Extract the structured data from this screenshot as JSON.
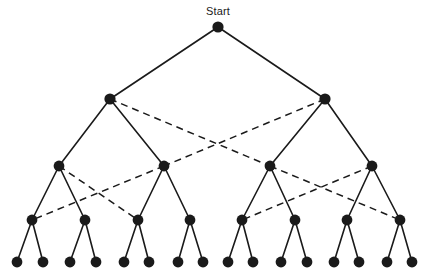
{
  "diagram": {
    "title": "Start",
    "type": "binary-decision-tree",
    "canvas": {
      "width": 430,
      "height": 278,
      "background": "#ffffff"
    },
    "colors": {
      "node": "#1a1a1a",
      "edge": "#1a1a1a",
      "dashed_edge": "#1a1a1a"
    },
    "labels": [
      {
        "id": "start-label",
        "text": "Start",
        "x": 218,
        "y": 5
      }
    ],
    "levels": [
      {
        "level": 0,
        "y": 27,
        "node_radius": 5.6
      },
      {
        "level": 1,
        "y": 99,
        "node_radius": 5.6
      },
      {
        "level": 2,
        "y": 166,
        "node_radius": 5.4
      },
      {
        "level": 3,
        "y": 220,
        "node_radius": 5.4
      },
      {
        "level": 4,
        "y": 262,
        "node_radius": 5.4
      }
    ],
    "nodes": [
      {
        "id": "n0",
        "level": 0,
        "x": 218,
        "y": 27,
        "r": 5.6
      },
      {
        "id": "n1a",
        "level": 1,
        "x": 110,
        "y": 99,
        "r": 5.6
      },
      {
        "id": "n1b",
        "level": 1,
        "x": 325,
        "y": 99,
        "r": 5.6
      },
      {
        "id": "n2a",
        "level": 2,
        "x": 59,
        "y": 166,
        "r": 5.4
      },
      {
        "id": "n2b",
        "level": 2,
        "x": 164,
        "y": 166,
        "r": 5.4
      },
      {
        "id": "n2c",
        "level": 2,
        "x": 270,
        "y": 166,
        "r": 5.4
      },
      {
        "id": "n2d",
        "level": 2,
        "x": 372,
        "y": 166,
        "r": 5.4
      },
      {
        "id": "n3a",
        "level": 3,
        "x": 32,
        "y": 220,
        "r": 5.4
      },
      {
        "id": "n3b",
        "level": 3,
        "x": 85,
        "y": 220,
        "r": 5.4
      },
      {
        "id": "n3c",
        "level": 3,
        "x": 138,
        "y": 220,
        "r": 5.4
      },
      {
        "id": "n3d",
        "level": 3,
        "x": 190,
        "y": 220,
        "r": 5.4
      },
      {
        "id": "n3e",
        "level": 3,
        "x": 242,
        "y": 220,
        "r": 5.4
      },
      {
        "id": "n3f",
        "level": 3,
        "x": 295,
        "y": 220,
        "r": 5.4
      },
      {
        "id": "n3g",
        "level": 3,
        "x": 347,
        "y": 220,
        "r": 5.4
      },
      {
        "id": "n3h",
        "level": 3,
        "x": 400,
        "y": 220,
        "r": 5.4
      },
      {
        "id": "n4a",
        "level": 4,
        "x": 17,
        "y": 262,
        "r": 5.4
      },
      {
        "id": "n4b",
        "level": 4,
        "x": 43,
        "y": 262,
        "r": 5.4
      },
      {
        "id": "n4c",
        "level": 4,
        "x": 70,
        "y": 262,
        "r": 5.4
      },
      {
        "id": "n4d",
        "level": 4,
        "x": 96,
        "y": 262,
        "r": 5.4
      },
      {
        "id": "n4e",
        "level": 4,
        "x": 124,
        "y": 262,
        "r": 5.4
      },
      {
        "id": "n4f",
        "level": 4,
        "x": 149,
        "y": 262,
        "r": 5.4
      },
      {
        "id": "n4g",
        "level": 4,
        "x": 178,
        "y": 262,
        "r": 5.4
      },
      {
        "id": "n4h",
        "level": 4,
        "x": 203,
        "y": 262,
        "r": 5.4
      },
      {
        "id": "n4i",
        "level": 4,
        "x": 228,
        "y": 262,
        "r": 5.4
      },
      {
        "id": "n4j",
        "level": 4,
        "x": 253,
        "y": 262,
        "r": 5.4
      },
      {
        "id": "n4k",
        "level": 4,
        "x": 281,
        "y": 262,
        "r": 5.4
      },
      {
        "id": "n4l",
        "level": 4,
        "x": 307,
        "y": 262,
        "r": 5.4
      },
      {
        "id": "n4m",
        "level": 4,
        "x": 334,
        "y": 262,
        "r": 5.4
      },
      {
        "id": "n4n",
        "level": 4,
        "x": 359,
        "y": 262,
        "r": 5.4
      },
      {
        "id": "n4o",
        "level": 4,
        "x": 387,
        "y": 262,
        "r": 5.4
      },
      {
        "id": "n4p",
        "level": 4,
        "x": 412,
        "y": 262,
        "r": 5.4
      }
    ],
    "edges_solid": [
      {
        "from": "n0",
        "to": "n1a",
        "x1": 218,
        "y1": 27,
        "x2": 110,
        "y2": 99
      },
      {
        "from": "n0",
        "to": "n1b",
        "x1": 218,
        "y1": 27,
        "x2": 325,
        "y2": 99
      },
      {
        "from": "n1a",
        "to": "n2a",
        "x1": 110,
        "y1": 99,
        "x2": 59,
        "y2": 166
      },
      {
        "from": "n1a",
        "to": "n2b",
        "x1": 110,
        "y1": 99,
        "x2": 164,
        "y2": 166
      },
      {
        "from": "n1b",
        "to": "n2c",
        "x1": 325,
        "y1": 99,
        "x2": 270,
        "y2": 166
      },
      {
        "from": "n1b",
        "to": "n2d",
        "x1": 325,
        "y1": 99,
        "x2": 372,
        "y2": 166
      },
      {
        "from": "n2a",
        "to": "n3a",
        "x1": 59,
        "y1": 166,
        "x2": 32,
        "y2": 220
      },
      {
        "from": "n2a",
        "to": "n3b",
        "x1": 59,
        "y1": 166,
        "x2": 85,
        "y2": 220
      },
      {
        "from": "n2b",
        "to": "n3c",
        "x1": 164,
        "y1": 166,
        "x2": 138,
        "y2": 220
      },
      {
        "from": "n2b",
        "to": "n3d",
        "x1": 164,
        "y1": 166,
        "x2": 190,
        "y2": 220
      },
      {
        "from": "n2c",
        "to": "n3e",
        "x1": 270,
        "y1": 166,
        "x2": 242,
        "y2": 220
      },
      {
        "from": "n2c",
        "to": "n3f",
        "x1": 270,
        "y1": 166,
        "x2": 295,
        "y2": 220
      },
      {
        "from": "n2d",
        "to": "n3g",
        "x1": 372,
        "y1": 166,
        "x2": 347,
        "y2": 220
      },
      {
        "from": "n2d",
        "to": "n3h",
        "x1": 372,
        "y1": 166,
        "x2": 400,
        "y2": 220
      },
      {
        "from": "n3a",
        "to": "n4a",
        "x1": 32,
        "y1": 220,
        "x2": 17,
        "y2": 262
      },
      {
        "from": "n3a",
        "to": "n4b",
        "x1": 32,
        "y1": 220,
        "x2": 43,
        "y2": 262
      },
      {
        "from": "n3b",
        "to": "n4c",
        "x1": 85,
        "y1": 220,
        "x2": 70,
        "y2": 262
      },
      {
        "from": "n3b",
        "to": "n4d",
        "x1": 85,
        "y1": 220,
        "x2": 96,
        "y2": 262
      },
      {
        "from": "n3c",
        "to": "n4e",
        "x1": 138,
        "y1": 220,
        "x2": 124,
        "y2": 262
      },
      {
        "from": "n3c",
        "to": "n4f",
        "x1": 138,
        "y1": 220,
        "x2": 149,
        "y2": 262
      },
      {
        "from": "n3d",
        "to": "n4g",
        "x1": 190,
        "y1": 220,
        "x2": 178,
        "y2": 262
      },
      {
        "from": "n3d",
        "to": "n4h",
        "x1": 190,
        "y1": 220,
        "x2": 203,
        "y2": 262
      },
      {
        "from": "n3e",
        "to": "n4i",
        "x1": 242,
        "y1": 220,
        "x2": 228,
        "y2": 262
      },
      {
        "from": "n3e",
        "to": "n4j",
        "x1": 242,
        "y1": 220,
        "x2": 253,
        "y2": 262
      },
      {
        "from": "n3f",
        "to": "n4k",
        "x1": 295,
        "y1": 220,
        "x2": 281,
        "y2": 262
      },
      {
        "from": "n3f",
        "to": "n4l",
        "x1": 295,
        "y1": 220,
        "x2": 307,
        "y2": 262
      },
      {
        "from": "n3g",
        "to": "n4m",
        "x1": 347,
        "y1": 220,
        "x2": 334,
        "y2": 262
      },
      {
        "from": "n3g",
        "to": "n4n",
        "x1": 347,
        "y1": 220,
        "x2": 359,
        "y2": 262
      },
      {
        "from": "n3h",
        "to": "n4o",
        "x1": 400,
        "y1": 220,
        "x2": 387,
        "y2": 262
      },
      {
        "from": "n3h",
        "to": "n4p",
        "x1": 400,
        "y1": 220,
        "x2": 412,
        "y2": 262
      }
    ],
    "edges_dashed": [
      {
        "from": "n1a",
        "to": "n2c",
        "x1": 110,
        "y1": 99,
        "x2": 270,
        "y2": 166
      },
      {
        "from": "n1b",
        "to": "n2b",
        "x1": 325,
        "y1": 99,
        "x2": 164,
        "y2": 166
      },
      {
        "from": "n2a",
        "to": "n3c",
        "x1": 59,
        "y1": 166,
        "x2": 138,
        "y2": 220
      },
      {
        "from": "n2b",
        "to": "n3a",
        "x1": 164,
        "y1": 166,
        "x2": 32,
        "y2": 220
      },
      {
        "from": "n2c",
        "to": "n3h",
        "x1": 270,
        "y1": 166,
        "x2": 400,
        "y2": 220
      },
      {
        "from": "n2d",
        "to": "n3e",
        "x1": 372,
        "y1": 166,
        "x2": 242,
        "y2": 220
      }
    ]
  }
}
